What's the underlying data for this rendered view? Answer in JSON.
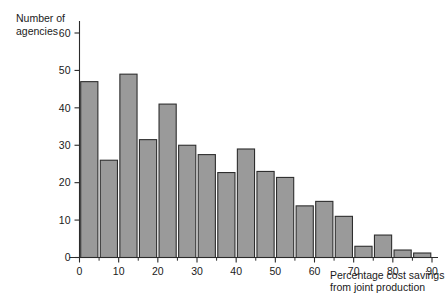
{
  "chart_data": {
    "type": "bar",
    "title": "",
    "subtitle": "",
    "xlabel_line1": "Percentage cost savings",
    "xlabel_line2": "from joint production",
    "ylabel_line1": "Number of",
    "ylabel_line2": "agencies",
    "xlim": [
      0,
      90
    ],
    "ylim": [
      0,
      62
    ],
    "bin_width": 5,
    "grid": false,
    "legend": null,
    "bar_color": "#9a9a9a",
    "bar_edge_color": "#2e2e2e",
    "axis_color": "#2b2b2b",
    "xticks": [
      0,
      10,
      20,
      30,
      40,
      50,
      60,
      70,
      80,
      90
    ],
    "xticklabels": [
      "0",
      "10",
      "20",
      "30",
      "40",
      "50",
      "60",
      "70",
      "80",
      "90"
    ],
    "xticks_minor": [
      5,
      15,
      25,
      35,
      45,
      55,
      65,
      75,
      85
    ],
    "yticks": [
      0,
      10,
      20,
      30,
      40,
      50,
      60
    ],
    "yticklabels": [
      "0",
      "10",
      "20",
      "30",
      "40",
      "50",
      "60"
    ],
    "bins": [
      {
        "left": 0,
        "right": 5,
        "value": 47
      },
      {
        "left": 5,
        "right": 10,
        "value": 26
      },
      {
        "left": 10,
        "right": 15,
        "value": 49
      },
      {
        "left": 15,
        "right": 20,
        "value": 31.5
      },
      {
        "left": 20,
        "right": 25,
        "value": 41
      },
      {
        "left": 25,
        "right": 30,
        "value": 30
      },
      {
        "left": 30,
        "right": 35,
        "value": 27.5
      },
      {
        "left": 35,
        "right": 40,
        "value": 22.7
      },
      {
        "left": 40,
        "right": 45,
        "value": 29
      },
      {
        "left": 45,
        "right": 50,
        "value": 23
      },
      {
        "left": 50,
        "right": 55,
        "value": 21.4
      },
      {
        "left": 55,
        "right": 60,
        "value": 13.8
      },
      {
        "left": 60,
        "right": 65,
        "value": 15
      },
      {
        "left": 65,
        "right": 70,
        "value": 11
      },
      {
        "left": 70,
        "right": 75,
        "value": 3
      },
      {
        "left": 75,
        "right": 80,
        "value": 6
      },
      {
        "left": 80,
        "right": 85,
        "value": 2
      },
      {
        "left": 85,
        "right": 90,
        "value": 1.2
      }
    ],
    "categories": [
      "0-5",
      "5-10",
      "10-15",
      "15-20",
      "20-25",
      "25-30",
      "30-35",
      "35-40",
      "40-45",
      "45-50",
      "50-55",
      "55-60",
      "60-65",
      "65-70",
      "70-75",
      "75-80",
      "80-85",
      "85-90"
    ],
    "values": [
      47,
      26,
      49,
      31.5,
      41,
      30,
      27.5,
      22.7,
      29,
      23,
      21.4,
      13.8,
      15,
      11,
      3,
      6,
      2,
      1.2
    ]
  }
}
